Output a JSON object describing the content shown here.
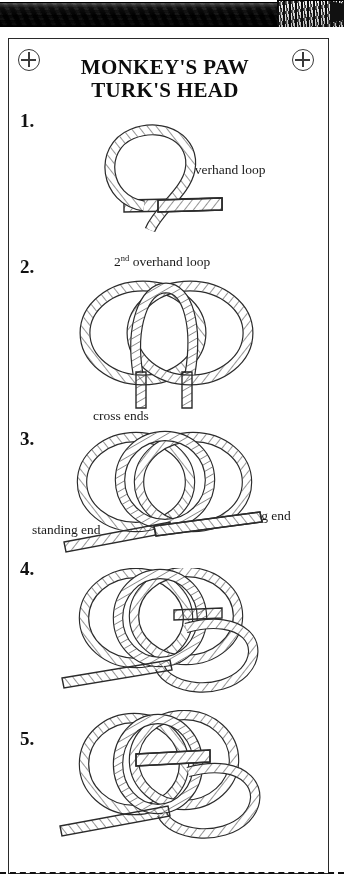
{
  "page": {
    "background_color": "#ffffff",
    "ink_color": "#1a1a1a",
    "frame_color": "#2a2a2a"
  },
  "banner": {
    "name": "rope-photograph-banner",
    "description": "photographic wire rope with whipped end"
  },
  "card": {
    "title_line_1": "MONKEY'S PAW",
    "title_line_2": "TURK'S HEAD",
    "registration_mark_left": "crosshair-target",
    "registration_mark_right": "crosshair-target"
  },
  "steps": [
    {
      "number": "1.",
      "diagram": "overhand-loop-single",
      "annotations": [
        {
          "id": "overhand-loop",
          "text": "overhand loop"
        }
      ]
    },
    {
      "number": "2.",
      "diagram": "two-overhand-loops-interlocked",
      "annotations": [
        {
          "id": "second-overhand-loop",
          "text_main": "2",
          "text_sup": "nd",
          "text_tail": " overhand loop"
        },
        {
          "id": "cross-ends",
          "text": "cross ends"
        }
      ]
    },
    {
      "number": "3.",
      "diagram": "three-interlocked-loops-with-ends",
      "annotations": [
        {
          "id": "standing-end",
          "text": "standing end"
        },
        {
          "id": "running-end",
          "text": "running end"
        }
      ]
    },
    {
      "number": "4.",
      "diagram": "four-loop-weave",
      "annotations": []
    },
    {
      "number": "5.",
      "diagram": "turks-head-tightening",
      "annotations": []
    }
  ],
  "cut_line": {
    "style": "dashed",
    "label": "cut-line"
  }
}
